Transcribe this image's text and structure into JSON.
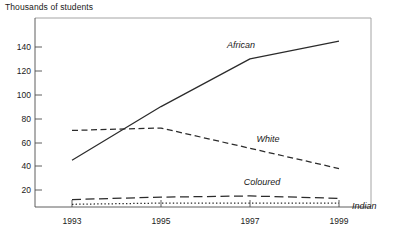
{
  "chart_data": {
    "type": "line",
    "title": "Thousands of students",
    "subtitle": "",
    "xlabel": "",
    "ylabel": "Thousands of students",
    "x": [
      1993,
      1995,
      1997,
      1999
    ],
    "xticklabels": [
      "1993",
      "1995",
      "1997",
      "1999"
    ],
    "yticks": [
      20,
      40,
      60,
      80,
      100,
      120,
      140
    ],
    "yticklabels": [
      "20",
      "40",
      "60",
      "80",
      "100",
      "120",
      "140"
    ],
    "xlim": [
      1993,
      1999
    ],
    "ylim": [
      0,
      152
    ],
    "grid": false,
    "legend_position": "inline-annotations",
    "series": [
      {
        "name": "African",
        "label": "African",
        "linestyle": "solid",
        "color": "#2b2b2b",
        "values": [
          45,
          90,
          130,
          145
        ]
      },
      {
        "name": "White",
        "label": "White",
        "linestyle": "dashed",
        "color": "#2b2b2b",
        "values": [
          70,
          72,
          55,
          38
        ]
      },
      {
        "name": "Coloured",
        "label": "Coloured",
        "linestyle": "long-dashed",
        "color": "#2b2b2b",
        "values": [
          12,
          14,
          15,
          13
        ]
      },
      {
        "name": "Indian",
        "label": "Indian",
        "linestyle": "dotted",
        "color": "#2b2b2b",
        "values": [
          8,
          9,
          9,
          9
        ]
      }
    ],
    "annotations": [
      {
        "text": "African",
        "x": 1996.3,
        "y": 141
      },
      {
        "text": "White",
        "x": 1996.9,
        "y": 63
      },
      {
        "text": "Coloured",
        "x": 1996.4,
        "y": 24
      },
      {
        "text": "Indian",
        "x": 1999.3,
        "y": 7
      }
    ]
  },
  "axes": {
    "y_tick_values": [
      "140",
      "120",
      "100",
      "80",
      "60",
      "40",
      "20"
    ],
    "x_tick_values": [
      "1993",
      "1995",
      "1997",
      "1999"
    ]
  }
}
